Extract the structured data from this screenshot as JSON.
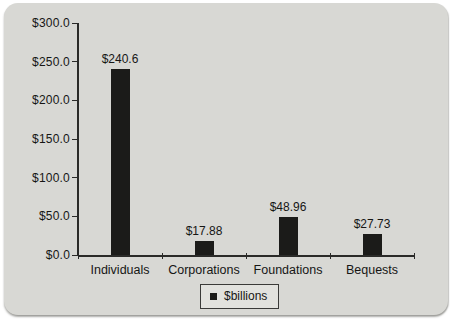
{
  "page": {
    "background_color": "#ffffff"
  },
  "card": {
    "background_color": "#d8d8d4"
  },
  "chart_data": {
    "type": "bar",
    "title": "",
    "xlabel": "",
    "ylabel": "",
    "categories": [
      "Individuals",
      "Corporations",
      "Foundations",
      "Bequests"
    ],
    "values": [
      240.6,
      17.88,
      48.96,
      27.73
    ],
    "value_labels": [
      "$240.6",
      "$17.88",
      "$48.96",
      "$27.73"
    ],
    "ylim": [
      0,
      300
    ],
    "y_tick_interval": 50,
    "y_tick_labels_top_to_bottom": [
      "$300.0",
      "$250.0",
      "$200.0",
      "$150.0",
      "$100.0",
      "$50.0",
      "$0.0"
    ],
    "grid": false,
    "bar_color": "#1b1b19",
    "text_color": "#161614",
    "legend": {
      "label": "$billions",
      "position": "bottom-center",
      "marker": "square-icon",
      "marker_color": "#1b1b19"
    }
  }
}
